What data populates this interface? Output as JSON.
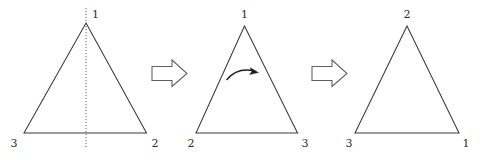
{
  "figure": {
    "background_color": "#ffffff",
    "stroke_color": "#3a3a3a",
    "arrow_stroke_color": "#5d5d5d",
    "arrow_fill_color": "#ffffff",
    "rotation_arrow_color": "#1d1d1d",
    "fold_axis_color": "#5a5a5a"
  },
  "triangles": [
    {
      "name": "triangle-1",
      "apex_label": "1",
      "bottom_left_label": "3",
      "bottom_right_label": "2",
      "has_fold_axis": true,
      "has_rotation_arrow": false
    },
    {
      "name": "triangle-2",
      "apex_label": "1",
      "bottom_left_label": "2",
      "bottom_right_label": "3",
      "has_fold_axis": false,
      "has_rotation_arrow": true
    },
    {
      "name": "triangle-3",
      "apex_label": "2",
      "bottom_left_label": "3",
      "bottom_right_label": "1",
      "has_fold_axis": false,
      "has_rotation_arrow": false
    }
  ],
  "arrows": [
    {
      "name": "step-arrow-1",
      "direction": "right"
    },
    {
      "name": "step-arrow-2",
      "direction": "right"
    }
  ]
}
